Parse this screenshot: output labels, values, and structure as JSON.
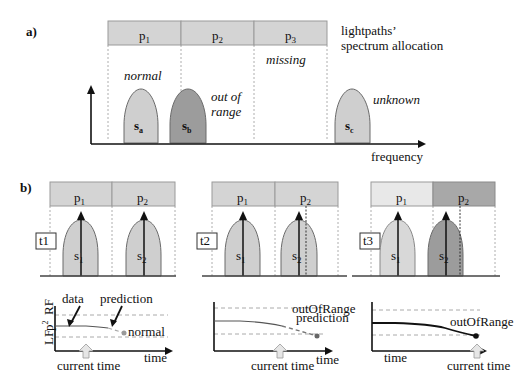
{
  "panel_a": {
    "label": "a)",
    "channels": [
      {
        "name": "p",
        "sub": "1"
      },
      {
        "name": "p",
        "sub": "2"
      },
      {
        "name": "p",
        "sub": "3"
      }
    ],
    "caption_line1": "lightpaths’",
    "caption_line2": "spectrum allocation",
    "annotations": {
      "normal": "normal",
      "out_of_line1": "out of",
      "out_of_line2": "range",
      "missing": "missing",
      "unknown": "unknown"
    },
    "signals": [
      {
        "name": "s",
        "sub": "a",
        "state": "normal"
      },
      {
        "name": "s",
        "sub": "b",
        "state": "out of range"
      },
      {
        "name": "s",
        "sub": "c",
        "state": "unknown"
      }
    ],
    "x_axis_label": "frequency"
  },
  "panel_b": {
    "label": "b)",
    "snapshots": [
      {
        "time_tag": "t1",
        "channels": [
          {
            "name": "p",
            "sub": "1"
          },
          {
            "name": "p",
            "sub": "2"
          }
        ],
        "signals": [
          {
            "name": "s",
            "sub": "1"
          },
          {
            "name": "s",
            "sub": "2"
          }
        ],
        "chart": {
          "y_label_low": "LF",
          "y_label_mid": "p",
          "y_label_mid_sup": "2",
          "y_label_high": "RF",
          "data_label": "data",
          "prediction_label": "prediction",
          "status_label": "normal",
          "current_time_label": "current time",
          "x_label": "time"
        }
      },
      {
        "time_tag": "t2",
        "channels": [
          {
            "name": "p",
            "sub": "1"
          },
          {
            "name": "p",
            "sub": "2"
          }
        ],
        "signals": [
          {
            "name": "s",
            "sub": "1"
          },
          {
            "name": "s",
            "sub": "2"
          }
        ],
        "chart": {
          "status_label": "outOfRange",
          "prediction_label": "prediction",
          "current_time_label": "current time",
          "x_label": "time"
        }
      },
      {
        "time_tag": "t3",
        "channels": [
          {
            "name": "p",
            "sub": "1"
          },
          {
            "name": "p",
            "sub": "2"
          }
        ],
        "signals": [
          {
            "name": "s",
            "sub": "1"
          },
          {
            "name": "s",
            "sub": "2"
          }
        ],
        "chart": {
          "status_label": "outOfRange",
          "current_time_label": "current time",
          "x_label": "time"
        }
      }
    ]
  }
}
